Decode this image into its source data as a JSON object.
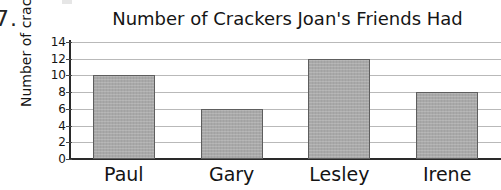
{
  "page": {
    "exercise_number": "7.",
    "background_color": "#ffffff"
  },
  "chart_data": {
    "type": "bar",
    "title": "Number of Crackers Joan's Friends Had",
    "xlabel": "",
    "ylabel": "Number of crackers",
    "categories": [
      "Paul",
      "Gary",
      "Lesley",
      "Irene"
    ],
    "values": [
      10,
      6,
      12,
      8
    ],
    "ylim": [
      0,
      14
    ],
    "y_tick_step": 2,
    "y_tick_labels": [
      "14",
      "12",
      "10",
      "8",
      "6",
      "4",
      "2",
      "0"
    ],
    "y_tick_values": [
      14,
      12,
      10,
      8,
      6,
      4,
      2,
      0
    ],
    "grid": true,
    "grid_axis": "y",
    "legend": false,
    "bar_fill_color": "#a9a9a9",
    "bar_edge_color": "#5e5e5e",
    "gridline_color": "#b9b9b9",
    "axis_color": "#2a2a2a"
  }
}
